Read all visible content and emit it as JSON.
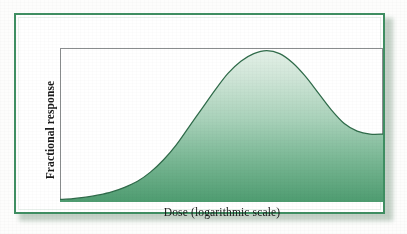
{
  "figure": {
    "background_color": "#ffffff",
    "frame_color": "#3f8f62",
    "plot_border_color": "#8a8d8e",
    "curve_line_color": "#2f6b4a",
    "fill_top_color": "#dbece1",
    "fill_bottom_color": "#4f9d71"
  },
  "chart_data": {
    "type": "area",
    "title": "",
    "xlabel": "Dose (logarithmic scale)",
    "ylabel": "Fractional response",
    "grid": false,
    "legend": null,
    "axis_ticks": {
      "x": [],
      "y": []
    },
    "xlim": [
      0,
      1
    ],
    "ylim": [
      0,
      1
    ],
    "series": [
      {
        "name": "Fractional response",
        "description": "Bell-shaped (biphasic) dose-response curve: low flat baseline at low dose, steep rise to a rounded peak at intermediate dose, then decline to an elevated plateau at high dose.",
        "x": [
          0.0,
          0.04,
          0.08,
          0.12,
          0.16,
          0.2,
          0.24,
          0.28,
          0.32,
          0.36,
          0.4,
          0.44,
          0.48,
          0.52,
          0.56,
          0.6,
          0.64,
          0.68,
          0.72,
          0.76,
          0.8,
          0.84,
          0.88,
          0.92,
          0.96,
          1.0
        ],
        "y": [
          0.01,
          0.015,
          0.025,
          0.04,
          0.06,
          0.09,
          0.13,
          0.19,
          0.27,
          0.37,
          0.49,
          0.61,
          0.73,
          0.84,
          0.92,
          0.97,
          0.99,
          0.97,
          0.91,
          0.82,
          0.71,
          0.6,
          0.51,
          0.46,
          0.44,
          0.44
        ]
      }
    ],
    "annotations": []
  }
}
